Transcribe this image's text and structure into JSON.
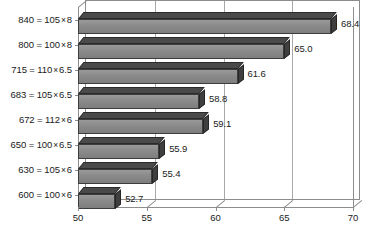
{
  "chart_data": {
    "type": "bar",
    "orientation": "horizontal",
    "title": "",
    "subtitle": "",
    "xlabel": "",
    "ylabel": "",
    "xlim": [
      50,
      70
    ],
    "xticks": [
      50,
      55,
      60,
      65,
      70
    ],
    "xtick_labels": [
      "50",
      "55",
      "60",
      "65",
      "70"
    ],
    "grid": true,
    "grid_axis": "x",
    "legend": null,
    "three_d": true,
    "bar_color": "#8a8a8a",
    "bar_top_color": "#4a4a4a",
    "bar_end_color": "#3f3f3f",
    "bar_outline_color": "#2b2b2b",
    "axis_color": "#8d8d8d",
    "gridline_color": "#a8a8a8",
    "text_color": "#1a1a1a",
    "background": "#ffffff",
    "categories": [
      "840 = 105 × 8",
      "800 = 100 × 8",
      "715 = 110 × 6.5",
      "683 = 105 × 6.5",
      "672 = 112 × 6",
      "650 = 100 × 6.5",
      "630 = 105 × 6",
      "600 = 100 × 6"
    ],
    "values": [
      68.4,
      65.0,
      61.6,
      58.8,
      59.1,
      55.9,
      55.4,
      52.7
    ],
    "data_labels": [
      "68.4",
      "65.0",
      "61.6",
      "58.8",
      "59.1",
      "55.9",
      "55.4",
      "52.7"
    ],
    "bars": [
      {
        "category_value": "840",
        "category_width": "105",
        "category_height": "8",
        "category": "840 = 105 × 8",
        "value": 68.4,
        "label": "68.4"
      },
      {
        "category_value": "800",
        "category_width": "100",
        "category_height": "8",
        "category": "800 = 100 × 8",
        "value": 65.0,
        "label": "65.0"
      },
      {
        "category_value": "715",
        "category_width": "110",
        "category_height": "6.5",
        "category": "715 = 110 × 6.5",
        "value": 61.6,
        "label": "61.6"
      },
      {
        "category_value": "683",
        "category_width": "105",
        "category_height": "6.5",
        "category": "683 = 105 × 6.5",
        "value": 58.8,
        "label": "58.8"
      },
      {
        "category_value": "672",
        "category_width": "112",
        "category_height": "6",
        "category": "672 = 112 × 6",
        "value": 59.1,
        "label": "59.1"
      },
      {
        "category_value": "650",
        "category_width": "100",
        "category_height": "6.5",
        "category": "650 = 100 × 6.5",
        "value": 55.9,
        "label": "55.9"
      },
      {
        "category_value": "630",
        "category_width": "105",
        "category_height": "6",
        "category": "630 = 105 × 6",
        "value": 55.4,
        "label": "55.4"
      },
      {
        "category_value": "600",
        "category_width": "100",
        "category_height": "6",
        "category": "600 = 100 × 6",
        "value": 52.7,
        "label": "52.7"
      }
    ]
  }
}
